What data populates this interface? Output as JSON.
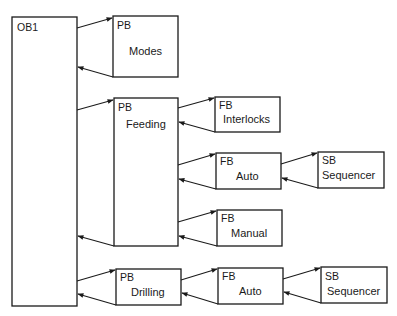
{
  "diagram": {
    "colors": {
      "line": "#1a1a1a",
      "background": "#ffffff"
    },
    "blocks": {
      "ob1": {
        "type": "OB1",
        "name": ""
      },
      "modes": {
        "type": "PB",
        "name": "Modes"
      },
      "feeding": {
        "type": "PB",
        "name": "Feeding"
      },
      "interlocks": {
        "type": "FB",
        "name": "Interlocks"
      },
      "feeding_auto": {
        "type": "FB",
        "name": "Auto"
      },
      "feeding_sequencer": {
        "type": "SB",
        "name": "Sequencer"
      },
      "manual": {
        "type": "FB",
        "name": "Manual"
      },
      "drilling": {
        "type": "PB",
        "name": "Drilling"
      },
      "drilling_auto": {
        "type": "FB",
        "name": "Auto"
      },
      "drilling_sequencer": {
        "type": "SB",
        "name": "Sequencer"
      }
    },
    "connections": [
      {
        "from": "OB1",
        "to": "PB Modes",
        "kind": "call/return"
      },
      {
        "from": "OB1",
        "to": "PB Feeding",
        "kind": "call/return"
      },
      {
        "from": "PB Feeding",
        "to": "FB Interlocks",
        "kind": "call/return"
      },
      {
        "from": "PB Feeding",
        "to": "FB Auto",
        "kind": "call/return"
      },
      {
        "from": "FB Auto",
        "to": "SB Sequencer",
        "kind": "call/return"
      },
      {
        "from": "PB Feeding",
        "to": "FB Manual",
        "kind": "call/return"
      },
      {
        "from": "OB1",
        "to": "PB Drilling",
        "kind": "call/return"
      },
      {
        "from": "PB Drilling",
        "to": "FB Auto",
        "kind": "call/return"
      },
      {
        "from": "FB Auto",
        "to": "SB Sequencer",
        "kind": "call/return"
      }
    ]
  }
}
